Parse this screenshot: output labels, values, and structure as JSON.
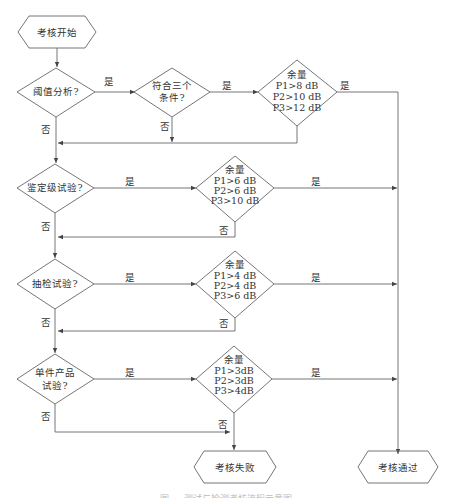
{
  "terminals": {
    "start": "考核开始",
    "fail": "考核失败",
    "pass": "考核通过"
  },
  "stages": [
    {
      "question": [
        "阈值分析?"
      ],
      "precheck": [
        "符合三个",
        "条件?"
      ],
      "margin_title": "余量",
      "margins": [
        "P1>8 dB",
        "P2>10 dB",
        "P3>12 dB"
      ]
    },
    {
      "question": [
        "鉴定级试验?"
      ],
      "margin_title": "余量",
      "margins": [
        "P1>6 dB",
        "P2>6 dB",
        "P3>10 dB"
      ]
    },
    {
      "question": [
        "抽检试验?"
      ],
      "margin_title": "余量",
      "margins": [
        "P1>4 dB",
        "P2>4 dB",
        "P3>6 dB"
      ]
    },
    {
      "question": [
        "单件产品",
        "试验?"
      ],
      "margin_title": "余量",
      "margins": [
        "P1>3dB",
        "P2>3dB",
        "P3>4dB"
      ]
    }
  ],
  "edge_labels": {
    "yes": "是",
    "no": "否"
  },
  "caption": "图 — 测试与检测考核流程示意图",
  "colors": {
    "line": "#555555",
    "text": "#333333",
    "background": "#ffffff"
  }
}
